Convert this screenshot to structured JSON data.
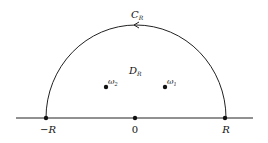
{
  "diagram": {
    "contour_label": "C",
    "contour_sub": "R",
    "region_label": "D",
    "region_sub": "R",
    "points": [
      {
        "name": "omega-2",
        "symbol": "ω",
        "sub": "2"
      },
      {
        "name": "omega-1",
        "symbol": "ω",
        "sub": "1"
      }
    ],
    "axis_ticks": [
      {
        "label": "−R"
      },
      {
        "label": "0"
      },
      {
        "label": "R"
      }
    ],
    "colors": {
      "stroke": "#222222",
      "background": "#ffffff"
    }
  }
}
